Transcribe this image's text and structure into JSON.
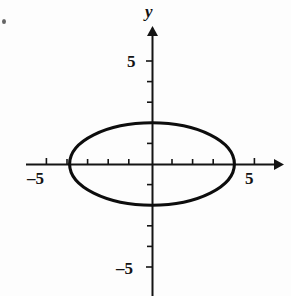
{
  "figure": {
    "title": "",
    "background_color": "#fdfdfd",
    "ink_color": "#111111"
  },
  "labels": {
    "y_axis_name": "y",
    "x_axis_name": "",
    "x_tick_negative": "–5",
    "x_tick_positive": "5",
    "y_tick_positive": "5",
    "y_tick_negative": "–5"
  },
  "chart_data": {
    "type": "line",
    "title": "",
    "xlabel": "",
    "ylabel": "y",
    "curve": "ellipse",
    "center": [
      0,
      0
    ],
    "semi_axis_x": 4,
    "semi_axis_y": 2,
    "equation": "x^2/16 + y^2/4 = 1",
    "x_intercepts": [
      -4,
      4
    ],
    "y_intercepts": [
      -2,
      2
    ],
    "xlim": [
      -6.1,
      6.3
    ],
    "ylim": [
      -6.4,
      6.6
    ],
    "xticks": [
      -5,
      -4,
      -3,
      -2,
      -1,
      1,
      2,
      3,
      4,
      5
    ],
    "yticks": [
      -5,
      -4,
      -3,
      -2,
      -1,
      1,
      2,
      3,
      4,
      5
    ],
    "xtick_labels": [
      {
        "value": -5,
        "text": "–5"
      },
      {
        "value": 5,
        "text": "5"
      }
    ],
    "ytick_labels": [
      {
        "value": 5,
        "text": "5"
      },
      {
        "value": -5,
        "text": "–5"
      }
    ],
    "grid": false,
    "legend": false,
    "axis_arrows": [
      "x-positive",
      "y-positive"
    ],
    "series": [
      {
        "name": "ellipse",
        "x": [
          4.0,
          3.86,
          3.46,
          2.83,
          2.0,
          1.04,
          0.0,
          -1.04,
          -2.0,
          -2.83,
          -3.46,
          -3.86,
          -4.0,
          -3.86,
          -3.46,
          -2.83,
          -2.0,
          -1.04,
          0.0,
          1.04,
          2.0,
          2.83,
          3.46,
          3.86,
          4.0
        ],
        "y": [
          0.0,
          0.52,
          1.0,
          1.41,
          1.73,
          1.93,
          2.0,
          1.93,
          1.73,
          1.41,
          1.0,
          0.52,
          0.0,
          -0.52,
          -1.0,
          -1.41,
          -1.73,
          -1.93,
          -2.0,
          -1.93,
          -1.73,
          -1.41,
          -1.0,
          -0.52,
          0.0
        ]
      }
    ]
  },
  "geometry": {
    "origin_px": [
      152,
      164
    ],
    "unit_px": 20.6,
    "ellipse_rx_px": 83,
    "ellipse_ry_px": 39,
    "x_axis_start_px": 26,
    "x_axis_end_px": 281,
    "y_axis_top_px": 28,
    "y_axis_bottom_px": 296
  }
}
